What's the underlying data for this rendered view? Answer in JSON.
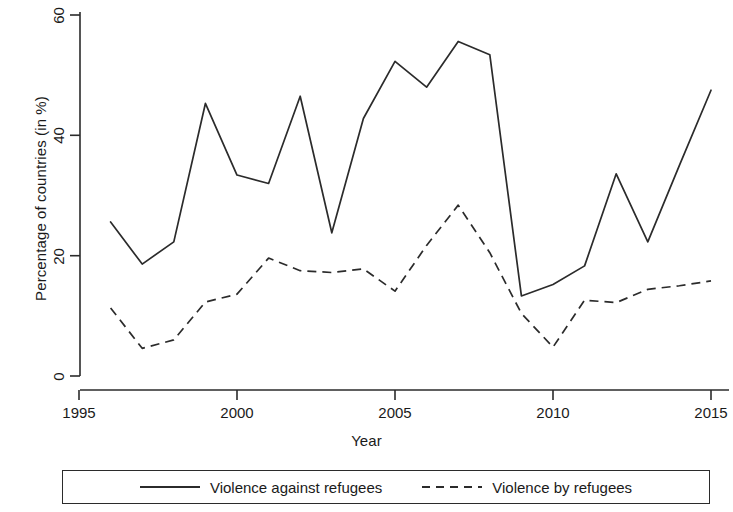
{
  "chart_data": {
    "type": "line",
    "title": "",
    "xlabel": "Year",
    "ylabel": "Percentage of countries (in %)",
    "xlim": [
      1995,
      2015
    ],
    "ylim": [
      0,
      60
    ],
    "xticks": [
      1995,
      2000,
      2005,
      2010,
      2015
    ],
    "yticks": [
      0,
      20,
      40,
      60
    ],
    "grid": false,
    "legend_position": "bottom",
    "x": [
      1996,
      1997,
      1998,
      1999,
      2000,
      2001,
      2002,
      2003,
      2004,
      2005,
      2006,
      2007,
      2008,
      2009,
      2010,
      2011,
      2012,
      2013,
      2014,
      2015
    ],
    "series": [
      {
        "name": "Violence against refugees",
        "style": "solid",
        "color": "#2b2b2b",
        "values": [
          25.6,
          18.6,
          22.3,
          45.3,
          33.4,
          32.0,
          46.5,
          23.8,
          42.8,
          52.3,
          48.0,
          55.6,
          53.4,
          13.3,
          15.2,
          18.3,
          33.6,
          22.3,
          35.0,
          47.5
        ]
      },
      {
        "name": "Violence by refugees",
        "style": "dashed",
        "color": "#2b2b2b",
        "values": [
          11.3,
          4.6,
          6.0,
          12.3,
          13.6,
          19.6,
          17.5,
          17.2,
          17.8,
          14.1,
          21.7,
          28.4,
          20.5,
          10.4,
          4.8,
          12.6,
          12.2,
          14.4,
          15.0,
          15.8
        ]
      }
    ]
  },
  "axes": {
    "y_title": "Percentage of countries (in %)",
    "x_title": "Year",
    "y_tick_labels": [
      "0",
      "20",
      "40",
      "60"
    ],
    "x_tick_labels": [
      "1995",
      "2000",
      "2005",
      "2010",
      "2015"
    ]
  },
  "legend": {
    "entries": [
      {
        "label": "Violence against refugees",
        "style": "solid"
      },
      {
        "label": "Violence by refugees",
        "style": "dashed"
      }
    ]
  },
  "colors": {
    "line": "#2b2b2b",
    "axis": "#2b2b2b",
    "background": "#ffffff",
    "text": "#1a1a1a"
  }
}
